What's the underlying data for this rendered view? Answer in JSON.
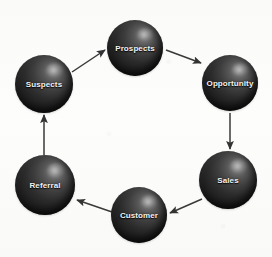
{
  "diagram": {
    "type": "cycle-diagram",
    "background_color": "#fdfdfc",
    "node_color_light": "#8e8e8e",
    "node_color_dark": "#111111",
    "label_color": "#f2f2f2",
    "arrow_color": "#3a3a3a",
    "nodes": [
      {
        "id": "suspects",
        "label": "Suspects",
        "cx": 44,
        "cy": 84,
        "r": 29
      },
      {
        "id": "prospects",
        "label": "Prospects",
        "cx": 135,
        "cy": 48,
        "r": 28
      },
      {
        "id": "opportunity",
        "label": "Opportunity",
        "cx": 230,
        "cy": 83,
        "r": 28
      },
      {
        "id": "sales",
        "label": "Sales",
        "cx": 228,
        "cy": 180,
        "r": 29
      },
      {
        "id": "customer",
        "label": "Customer",
        "cx": 139,
        "cy": 215,
        "r": 28
      },
      {
        "id": "referral",
        "label": "Referral",
        "cx": 45,
        "cy": 185,
        "r": 30
      }
    ],
    "arrows": [
      {
        "id": "suspects-to-prospects",
        "from": "Suspects",
        "to": "Prospects",
        "x1": 72,
        "y1": 72,
        "x2": 105,
        "y2": 50
      },
      {
        "id": "prospects-to-opportunity",
        "from": "Prospects",
        "to": "Opportunity",
        "x1": 166,
        "y1": 50,
        "x2": 201,
        "y2": 63
      },
      {
        "id": "opportunity-to-sales",
        "from": "Opportunity",
        "to": "Sales",
        "x1": 230,
        "y1": 113,
        "x2": 230,
        "y2": 149
      },
      {
        "id": "sales-to-customer",
        "from": "Sales",
        "to": "Customer",
        "x1": 202,
        "y1": 199,
        "x2": 170,
        "y2": 213
      },
      {
        "id": "customer-to-referral",
        "from": "Customer",
        "to": "Referral",
        "x1": 112,
        "y1": 212,
        "x2": 77,
        "y2": 200
      },
      {
        "id": "referral-to-suspects",
        "from": "Referral",
        "to": "Suspects",
        "x1": 44,
        "y1": 155,
        "x2": 44,
        "y2": 115
      }
    ]
  }
}
